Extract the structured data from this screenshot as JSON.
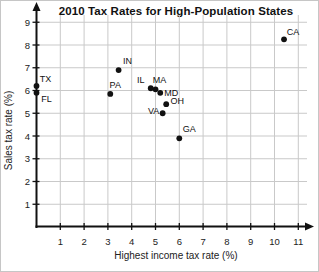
{
  "figure": {
    "title": "2010 Tax Rates for High-Population States"
  },
  "chart_data": {
    "type": "scatter",
    "title": "2010 Tax Rates for High-Population States",
    "xlabel": "Highest income tax rate (%)",
    "ylabel": "Sales tax rate (%)",
    "xlim": [
      0,
      11.6
    ],
    "ylim": [
      0,
      9.6
    ],
    "xticks": [
      1,
      2,
      3,
      4,
      5,
      6,
      7,
      8,
      9,
      10,
      11
    ],
    "yticks": [
      1,
      2,
      3,
      4,
      5,
      6,
      7,
      8,
      9
    ],
    "grid": true,
    "legend": "none",
    "grid_color": "#c9c9c9",
    "axis_color": "#111111",
    "marker_color": "#111111",
    "points": [
      {
        "label": "TX",
        "x": 0,
        "y": 6.2,
        "label_dx": 9,
        "label_dy": -7
      },
      {
        "label": "FL",
        "x": 0,
        "y": 5.9,
        "label_dx": 10,
        "label_dy": 6
      },
      {
        "label": "PA",
        "x": 3.1,
        "y": 5.85,
        "label_dx": 5,
        "label_dy": -9
      },
      {
        "label": "IN",
        "x": 3.45,
        "y": 6.9,
        "label_dx": 9,
        "label_dy": -9
      },
      {
        "label": "IL",
        "x": 4.8,
        "y": 6.1,
        "label_dx": -10,
        "label_dy": -8
      },
      {
        "label": "MA",
        "x": 5.0,
        "y": 6.05,
        "label_dx": 4,
        "label_dy": -9
      },
      {
        "label": "MD",
        "x": 5.2,
        "y": 5.9,
        "label_dx": 11,
        "label_dy": 0
      },
      {
        "label": "OH",
        "x": 5.45,
        "y": 5.4,
        "label_dx": 11,
        "label_dy": -3
      },
      {
        "label": "VA",
        "x": 5.3,
        "y": 5.0,
        "label_dx": -9,
        "label_dy": -2
      },
      {
        "label": "GA",
        "x": 6.0,
        "y": 3.9,
        "label_dx": 10,
        "label_dy": -9
      },
      {
        "label": "CA",
        "x": 10.4,
        "y": 8.25,
        "label_dx": 9,
        "label_dy": -7
      }
    ]
  }
}
